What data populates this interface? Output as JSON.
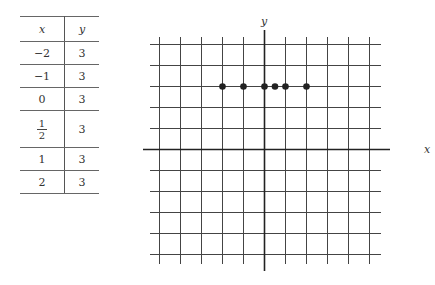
{
  "table": {
    "headers": [
      "x",
      "y"
    ],
    "rows": [
      {
        "x": "−2",
        "y": "3"
      },
      {
        "x": "−1",
        "y": "3"
      },
      {
        "x": "0",
        "y": "3"
      },
      {
        "x_num": "1",
        "x_den": "2",
        "y": "3"
      },
      {
        "x": "1",
        "y": "3"
      },
      {
        "x": "2",
        "y": "3"
      }
    ]
  },
  "chart_data": {
    "type": "scatter",
    "title": "",
    "xlabel": "x",
    "ylabel": "y",
    "x": [
      -2,
      -1,
      0,
      0.5,
      1,
      2
    ],
    "y": [
      3,
      3,
      3,
      3,
      3,
      3
    ],
    "xlim": [
      -5,
      5
    ],
    "ylim": [
      -5,
      5
    ],
    "grid": true,
    "legend": null
  }
}
